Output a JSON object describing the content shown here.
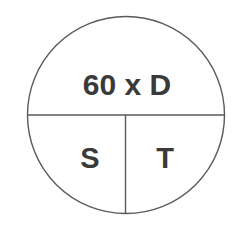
{
  "diagram": {
    "type": "formula-triangle-circle",
    "top_label": "60 x D",
    "bottom_left_label": "S",
    "bottom_right_label": "T",
    "colors": {
      "stroke": "#5a5a5a",
      "text": "#3a3a3a",
      "background": "#ffffff"
    }
  }
}
